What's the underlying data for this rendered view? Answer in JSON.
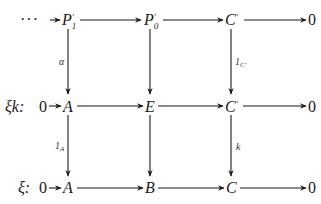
{
  "diagram": {
    "type": "commutative-diagram",
    "rows": [
      {
        "label": "",
        "prefix": "···",
        "nodes": [
          {
            "id": "P1p",
            "base": "P",
            "prime": "′",
            "sub": "1"
          },
          {
            "id": "P0p",
            "base": "P",
            "prime": "′",
            "sub": "0"
          },
          {
            "id": "Cp_top",
            "base": "C",
            "prime": "′",
            "sub": ""
          },
          {
            "id": "zero_top",
            "base": "0",
            "prime": "",
            "sub": ""
          }
        ]
      },
      {
        "label": "ξk:",
        "prefix": "0",
        "nodes": [
          {
            "id": "A_mid",
            "base": "A",
            "prime": "",
            "sub": ""
          },
          {
            "id": "E",
            "base": "E",
            "prime": "",
            "sub": ""
          },
          {
            "id": "Cp_mid",
            "base": "C",
            "prime": "′",
            "sub": ""
          },
          {
            "id": "zero_mid",
            "base": "0",
            "prime": "",
            "sub": ""
          }
        ]
      },
      {
        "label": "ξ:",
        "prefix": "0",
        "nodes": [
          {
            "id": "A_bot",
            "base": "A",
            "prime": "",
            "sub": ""
          },
          {
            "id": "B",
            "base": "B",
            "prime": "",
            "sub": ""
          },
          {
            "id": "C",
            "base": "C",
            "prime": "",
            "sub": ""
          },
          {
            "id": "zero_bot",
            "base": "0",
            "prime": "",
            "sub": ""
          }
        ]
      }
    ],
    "vertical_arrows": [
      {
        "from": "P1p",
        "to": "A_mid",
        "label": "α",
        "label_sub": ""
      },
      {
        "from": "P0p",
        "to": "E",
        "label": "",
        "label_sub": ""
      },
      {
        "from": "Cp_top",
        "to": "Cp_mid",
        "label": "1",
        "label_sub": "C′"
      },
      {
        "from": "A_mid",
        "to": "A_bot",
        "label": "1",
        "label_sub": "A"
      },
      {
        "from": "E",
        "to": "B",
        "label": "",
        "label_sub": ""
      },
      {
        "from": "Cp_mid",
        "to": "C",
        "label": "k",
        "label_sub": ""
      }
    ],
    "horizontal_arrows": [
      {
        "row": 0,
        "from": "prefix",
        "to": "P1p"
      },
      {
        "row": 0,
        "from": "P1p",
        "to": "P0p"
      },
      {
        "row": 0,
        "from": "P0p",
        "to": "Cp_top"
      },
      {
        "row": 0,
        "from": "Cp_top",
        "to": "zero_top"
      },
      {
        "row": 1,
        "from": "prefix",
        "to": "A_mid"
      },
      {
        "row": 1,
        "from": "A_mid",
        "to": "E"
      },
      {
        "row": 1,
        "from": "E",
        "to": "Cp_mid"
      },
      {
        "row": 1,
        "from": "Cp_mid",
        "to": "zero_mid"
      },
      {
        "row": 2,
        "from": "prefix",
        "to": "A_bot"
      },
      {
        "row": 2,
        "from": "A_bot",
        "to": "B"
      },
      {
        "row": 2,
        "from": "B",
        "to": "C"
      },
      {
        "row": 2,
        "from": "C",
        "to": "zero_bot"
      }
    ]
  }
}
